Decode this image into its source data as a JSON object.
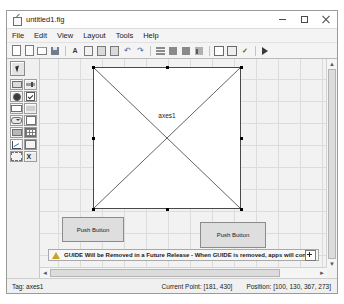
{
  "window": {
    "title": "untitled1.fig",
    "icon": "figure-file-icon",
    "controls": {
      "minimize": "minimize-icon",
      "maximize": "maximize-icon",
      "close": "close-icon"
    }
  },
  "menubar": {
    "items": [
      {
        "label": "File"
      },
      {
        "label": "Edit"
      },
      {
        "label": "View"
      },
      {
        "label": "Layout"
      },
      {
        "label": "Tools"
      },
      {
        "label": "Help"
      }
    ]
  },
  "toolbar": {
    "buttons": [
      {
        "name": "new-figure-icon"
      },
      {
        "name": "open-file-icon"
      },
      {
        "name": "folder-icon"
      },
      {
        "name": "save-icon"
      },
      {
        "name": "text-tool-icon"
      },
      {
        "name": "cut-icon"
      },
      {
        "name": "copy-icon"
      },
      {
        "name": "paste-icon"
      },
      {
        "name": "undo-icon"
      },
      {
        "name": "redo-icon"
      },
      {
        "name": "align-objects-icon"
      },
      {
        "name": "grid-and-rulers-icon"
      },
      {
        "name": "menu-editor-icon"
      },
      {
        "name": "toolbar-editor-icon"
      },
      {
        "name": "m-file-editor-icon"
      },
      {
        "name": "property-inspector-icon"
      },
      {
        "name": "object-browser-icon"
      },
      {
        "name": "run-figure-icon"
      }
    ]
  },
  "palette": {
    "pointer": {
      "name": "select-arrow-tool",
      "label": "Select"
    },
    "components": [
      {
        "name": "push-button-tool",
        "label": "Push Button"
      },
      {
        "name": "slider-tool",
        "label": "Slider"
      },
      {
        "name": "radio-button-tool",
        "label": "Radio Button"
      },
      {
        "name": "check-box-tool",
        "label": "Check Box"
      },
      {
        "name": "edit-text-tool",
        "label": "Edit Text"
      },
      {
        "name": "static-text-tool",
        "label": "Static Text"
      },
      {
        "name": "pop-up-menu-tool",
        "label": "Pop-up Menu"
      },
      {
        "name": "list-box-tool",
        "label": "Listbox"
      },
      {
        "name": "toggle-button-tool",
        "label": "Toggle Button"
      },
      {
        "name": "table-tool",
        "label": "Table"
      },
      {
        "name": "axes-tool",
        "label": "Axes"
      },
      {
        "name": "panel-tool",
        "label": "Panel"
      },
      {
        "name": "button-group-tool",
        "label": "Button Group"
      },
      {
        "name": "activex-control-tool",
        "label": "ActiveX Control"
      }
    ]
  },
  "canvas": {
    "axes": {
      "label": "axes1",
      "selected": true
    },
    "buttons": [
      {
        "label": "Push Button"
      },
      {
        "label": "Push Button"
      }
    ]
  },
  "warning": {
    "icon": "warning-triangle-icon",
    "text": "GUIDE Will be Removed in a Future Release - When GUIDE is removed, apps will continue to ru...",
    "expand_label": "expand-warning-icon"
  },
  "scrollbars": {
    "vertical": {
      "up": "▲",
      "down": "▼"
    },
    "horizontal": {
      "left": "◄",
      "right": "►"
    }
  },
  "statusbar": {
    "tag": "Tag: axes1",
    "current_point": "Current Point: [181, 430]",
    "position": "Position: [100, 130, 367, 273]"
  },
  "colors": {
    "window_bg": "#f0f0f0",
    "canvas_bg": "#f2f2f2",
    "grid_line": "#dcdcdc",
    "axes_fill": "#ffffff",
    "axes_border": "#4a4a4a",
    "button_fill": "#dedede",
    "warning_amber": "#c9a227"
  }
}
